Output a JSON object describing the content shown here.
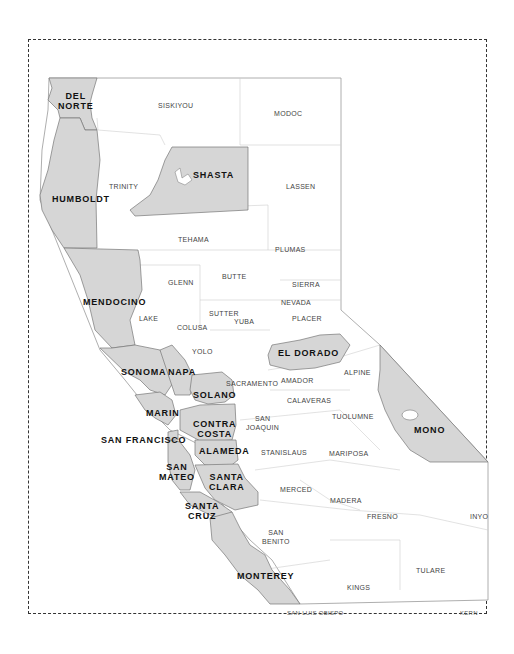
{
  "map": {
    "title": "Northern and Central California Counties",
    "colors": {
      "highlight_fill": "#d6d6d6",
      "base_fill": "#ffffff",
      "border": "#888888",
      "frame": "#333333",
      "highlight_text": "#111111",
      "base_text": "#444444"
    },
    "highlighted_counties": [
      "DEL NORTE",
      "HUMBOLDT",
      "SHASTA",
      "MENDOCINO",
      "SONOMA",
      "NAPA",
      "SOLANO",
      "MARIN",
      "CONTRA COSTA",
      "SAN FRANCISCO",
      "ALAMEDA",
      "SAN MATEO",
      "SANTA CLARA",
      "SANTA CRUZ",
      "MONTEREY",
      "EL DORADO",
      "MONO"
    ],
    "labels": {
      "del_norte_1": "DEL",
      "del_norte_2": "NORTE",
      "siskiyou": "SISKIYOU",
      "modoc": "MODOC",
      "shasta": "SHASTA",
      "trinity": "TRINITY",
      "lassen": "LASSEN",
      "humboldt": "HUMBOLDT",
      "tehama": "TEHAMA",
      "plumas": "PLUMAS",
      "glenn": "GLENN",
      "butte": "BUTTE",
      "sierra": "SIERRA",
      "nevada": "NEVADA",
      "mendocino": "MENDOCINO",
      "lake": "LAKE",
      "sutter": "SUTTER",
      "colusa": "COLUSA",
      "yuba": "YUBA",
      "placer": "PLACER",
      "yolo": "YOLO",
      "el_dorado": "EL DORADO",
      "sonoma": "SONOMA",
      "napa": "NAPA",
      "sacramento": "SACRAMENTO",
      "amador": "AMADOR",
      "alpine": "ALPINE",
      "solano": "SOLANO",
      "calaveras": "CALAVERAS",
      "marin": "MARIN",
      "san_joaquin_1": "SAN",
      "san_joaquin_2": "JOAQUIN",
      "tuolumne": "TUOLUMNE",
      "contra_costa_1": "CONTRA",
      "contra_costa_2": "COSTA",
      "mono": "MONO",
      "san_francisco": "SAN FRANCISCO",
      "alameda": "ALAMEDA",
      "stanislaus": "STANISLAUS",
      "mariposa": "MARIPOSA",
      "san_mateo_1": "SAN",
      "san_mateo_2": "MATEO",
      "santa_clara_1": "SANTA",
      "santa_clara_2": "CLARA",
      "merced": "MERCED",
      "madera": "MADERA",
      "santa_cruz_1": "SANTA",
      "santa_cruz_2": "CRUZ",
      "fresno": "FRESNO",
      "inyo": "INYO",
      "san_benito_1": "SAN",
      "san_benito_2": "BENITO",
      "monterey": "MONTEREY",
      "tulare": "TULARE",
      "kings": "KINGS",
      "san_luis_obispo": "SAN LUIS OBISPO",
      "kern": "KERN"
    }
  }
}
